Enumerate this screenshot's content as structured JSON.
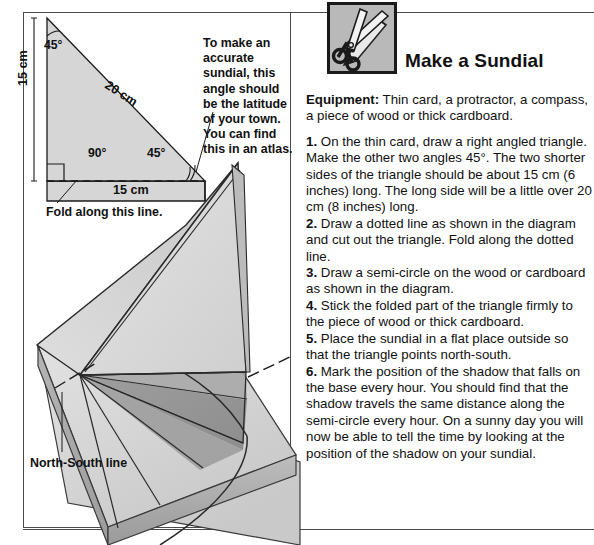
{
  "header": {
    "title": "Make a Sundial",
    "icon": "scissors-icon"
  },
  "equipment": {
    "label": "Equipment:",
    "text": " Thin card, a protractor, a compass, a piece of wood or thick cardboard."
  },
  "steps": [
    {
      "num": "1.",
      "text": " On the thin card, draw a right angled triangle. Make the other two angles 45°. The two shorter sides of the triangle should be about 15 cm (6 inches) long. The long side will be a little over 20 cm (8 inches) long."
    },
    {
      "num": "2.",
      "text": " Draw a dotted line as shown in the diagram and cut out the triangle. Fold along the dotted line."
    },
    {
      "num": "3.",
      "text": " Draw a semi-circle on the wood or cardboard as shown in the diagram."
    },
    {
      "num": "4.",
      "text": " Stick the folded part of the triangle firmly to the piece of wood or thick cardboard."
    },
    {
      "num": "5.",
      "text": " Place the sundial in a flat place outside so that the triangle points north-south."
    },
    {
      "num": "6.",
      "text": " Mark the position of the shadow that falls on the base every hour. You should find that the shadow travels the same distance along the semi-circle every hour. On a sunny day you will now be able to tell the time by looking at the position of the shadow on your sundial."
    }
  ],
  "diagram": {
    "note": "To make an accurate sundial, this angle should be the latitude of your town. You can find this in an atlas.",
    "fold_label": "Fold along this line.",
    "ns_label": "North-South line",
    "angle_top_left": "45°",
    "angle_right": "90°",
    "angle_bottom_right": "45°",
    "side_vertical": "15 cm",
    "side_hypotenuse": "20 cm",
    "side_base": "15 cm"
  },
  "colors": {
    "ink": "#1a1a1a",
    "rule": "#4a4a4a",
    "paper_light": "#dcdcdc",
    "paper_mid": "#c8c8c8",
    "paper_dark": "#a9a9a9",
    "shadow": "#8e8e8e"
  }
}
